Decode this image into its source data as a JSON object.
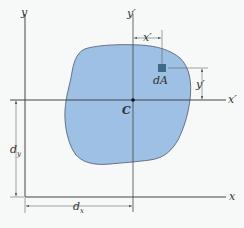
{
  "figure": {
    "colors": {
      "area_fill": "#9dc0e4",
      "area_stroke": "#4a5a6a",
      "element_fill": "#3d6a86",
      "axis": "#444444",
      "dim_line": "#666666",
      "background": "#f7f8f8"
    },
    "axes": {
      "x_label": "x",
      "y_label": "y",
      "x_prime_label": "x′",
      "y_prime_label": "y′"
    },
    "centroid": {
      "label": "C"
    },
    "element": {
      "label": "dA"
    },
    "dimensions": {
      "x_prime": "x′",
      "y_prime": "y′",
      "d_x_main": "d",
      "d_x_sub": "x",
      "d_y_main": "d",
      "d_y_sub": "y"
    }
  }
}
